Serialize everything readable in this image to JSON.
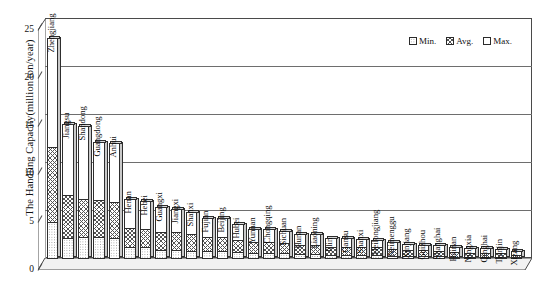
{
  "chart_data": {
    "type": "bar",
    "title": "",
    "xlabel": "",
    "ylabel": "The Handling Capacity(million ton/year)",
    "ylim": [
      0,
      25
    ],
    "yticks": [
      0,
      5,
      10,
      15,
      20,
      25
    ],
    "grid": true,
    "legend_position": "top-right",
    "stacked_note": "Each bar shows Min. (bottom, dotted), Avg. (middle, hatched) and Max. (top, white) handling capacity",
    "categories": [
      "Zhengjiang",
      "Jiangsu",
      "Shandong",
      "Guangdong",
      "Anhui",
      "Henan",
      "Hebei",
      "Guangxi",
      "Jiangxi",
      "Shanxi",
      "Fujian",
      "Beijing",
      "Hubei",
      "Yunnan",
      "Chongqing",
      "Sichuan",
      "Hunan",
      "Liaoning",
      "Jilin",
      "Gansu",
      "Shanxi",
      "Heilongjiang",
      "Neimenggu",
      "Xinjiang",
      "Guizhou",
      "Shanghai",
      "Hainan",
      "Ningxia",
      "Qinghai",
      "Tianjin",
      "Xizang"
    ],
    "series": [
      {
        "name": "Min.",
        "values": [
          3.9,
          2.2,
          2.3,
          2.3,
          2.2,
          1.2,
          1.2,
          0.9,
          0.9,
          0.8,
          0.8,
          0.8,
          0.7,
          0.6,
          0.6,
          0.6,
          0.5,
          0.5,
          0.4,
          0.4,
          0.4,
          0.4,
          0.35,
          0.3,
          0.3,
          0.3,
          0.25,
          0.2,
          0.2,
          0.2,
          0.15
        ]
      },
      {
        "name": "Avg.",
        "values": [
          11.7,
          6.7,
          6.3,
          6.1,
          5.9,
          3.2,
          3.1,
          2.8,
          2.8,
          2.6,
          2.3,
          2.3,
          2.0,
          1.8,
          1.8,
          1.7,
          1.5,
          1.5,
          1.3,
          1.3,
          1.2,
          1.2,
          1.0,
          0.9,
          0.9,
          0.8,
          0.7,
          0.6,
          0.6,
          0.6,
          0.45
        ]
      },
      {
        "name": "Max.",
        "values": [
          23.0,
          14.1,
          13.9,
          12.2,
          12.1,
          6.2,
          6.0,
          5.4,
          5.2,
          4.9,
          4.3,
          4.3,
          3.6,
          3.1,
          3.1,
          2.9,
          2.6,
          2.6,
          2.2,
          2.2,
          2.1,
          2.0,
          1.8,
          1.6,
          1.5,
          1.5,
          1.3,
          1.1,
          1.1,
          1.0,
          0.8
        ]
      }
    ]
  },
  "legend": {
    "items": [
      {
        "label": "Min.",
        "pattern": "dotted"
      },
      {
        "label": "Avg.",
        "pattern": "hatched"
      },
      {
        "label": "Max.",
        "pattern": "empty"
      }
    ]
  },
  "colors": {
    "axis": "#4a4a4a",
    "grid": "#6e6e6e",
    "bar_outline": "#2e2e2e",
    "background": "#ffffff"
  }
}
